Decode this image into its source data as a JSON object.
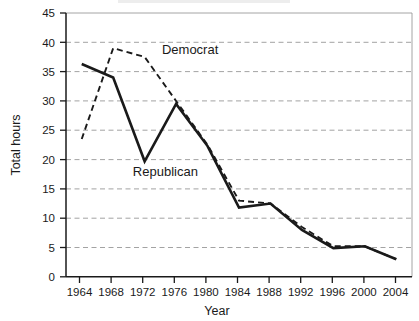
{
  "chart_data": {
    "type": "line",
    "title": "",
    "xlabel": "Year",
    "ylabel": "Total hours",
    "x": [
      1964,
      1968,
      1972,
      1976,
      1980,
      1984,
      1988,
      1992,
      1996,
      2000,
      2004
    ],
    "xlim": [
      1962,
      2006
    ],
    "ylim": [
      0,
      45
    ],
    "ytick_values": [
      0,
      5,
      10,
      15,
      20,
      25,
      30,
      35,
      40,
      45
    ],
    "ytick_labels": [
      "0",
      "5",
      "10",
      "15",
      "20",
      "25",
      "30",
      "35",
      "40",
      "45"
    ],
    "xtick_labels": [
      "1964",
      "1968",
      "1972",
      "1976",
      "1980",
      "1984",
      "1988",
      "1992",
      "1996",
      "2000",
      "2004"
    ],
    "grid": "horizontal-dashed",
    "legend_position": "inline-annotations",
    "series": [
      {
        "name": "Democrat",
        "style": "dashed",
        "color": "#1a1a1a",
        "values": [
          23.5,
          39.0,
          37.5,
          30.0,
          22.5,
          13.0,
          12.5,
          8.5,
          5.2,
          5.2,
          3.0
        ]
      },
      {
        "name": "Republican",
        "style": "solid",
        "color": "#1a1a1a",
        "values": [
          36.3,
          34.0,
          19.7,
          29.5,
          22.3,
          11.8,
          12.5,
          8.0,
          4.9,
          5.2,
          3.0
        ]
      }
    ],
    "annotations": [
      {
        "text": "Democrat",
        "x": 1974.2,
        "y": 38.0
      },
      {
        "text": "Republican",
        "x": 1970.5,
        "y": 17.2
      }
    ]
  },
  "axes": {
    "y_axis_title": "Total hours",
    "x_axis_title": "Year"
  }
}
